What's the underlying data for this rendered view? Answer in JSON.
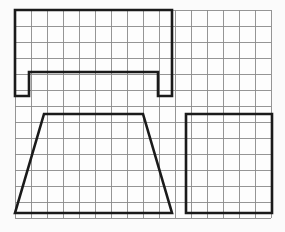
{
  "canvas": {
    "width": 285,
    "height": 232,
    "background_color": "#fbfbfb",
    "title": "Orthographic projection views on graph paper"
  },
  "grid": {
    "label": "graph-paper-grid",
    "origin_x": 15,
    "origin_y": 10,
    "cell_size": 16,
    "columns": 16,
    "rows": 13,
    "extent_x_end": 271,
    "extent_y_end": 218,
    "line_color": "#8a8a8a",
    "line_width": 0.9,
    "background_color": "#fdfdfd"
  },
  "style": {
    "outline_color": "#1a1a1a",
    "outline_width": 2.6,
    "outline_join": "miter",
    "fill": "none"
  },
  "views": [
    {
      "id": "top-view",
      "name": "notched-rectangle-view",
      "shape_type": "polygon",
      "description": "Rectangle with rectangular notch removed from bottom edge (channel / inverted U profile)",
      "grid_cells_wide": 9.8,
      "grid_cells_tall": 5.4,
      "bounds": {
        "x": 15,
        "y": 10,
        "width": 157,
        "height": 86
      },
      "points": [
        [
          15,
          10
        ],
        [
          172,
          10
        ],
        [
          172,
          96
        ],
        [
          158,
          96
        ],
        [
          158,
          72
        ],
        [
          29,
          72
        ],
        [
          29,
          96
        ],
        [
          15,
          96
        ]
      ]
    },
    {
      "id": "front-view",
      "name": "trapezoid-view",
      "shape_type": "polygon",
      "description": "Isosceles trapezoid, narrow top edge and wide bottom edge with symmetric slanted sides",
      "grid_cells_wide": 9.8,
      "grid_cells_tall": 6.2,
      "bounds": {
        "x": 15,
        "y": 114,
        "width": 157,
        "height": 99
      },
      "points": [
        [
          44,
          114
        ],
        [
          143,
          114
        ],
        [
          172,
          213
        ],
        [
          15,
          213
        ]
      ]
    },
    {
      "id": "side-view",
      "name": "square-view",
      "shape_type": "polygon",
      "description": "Plain square / rectangle outline",
      "grid_cells_wide": 5.4,
      "grid_cells_tall": 6.2,
      "bounds": {
        "x": 186,
        "y": 114,
        "width": 86,
        "height": 99
      },
      "points": [
        [
          186,
          114
        ],
        [
          272,
          114
        ],
        [
          272,
          213
        ],
        [
          186,
          213
        ]
      ]
    }
  ]
}
